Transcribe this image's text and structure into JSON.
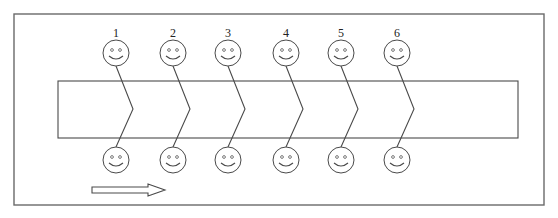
{
  "diagram": {
    "frame": {
      "x": 14,
      "y": 14,
      "width": 530,
      "height": 191
    },
    "band": {
      "x": 58,
      "y": 81,
      "width": 460,
      "height": 57
    },
    "figures": [
      {
        "label": "1",
        "x": 116
      },
      {
        "label": "2",
        "x": 173
      },
      {
        "label": "3",
        "x": 228
      },
      {
        "label": "4",
        "x": 286
      },
      {
        "label": "5",
        "x": 341
      },
      {
        "label": "6",
        "x": 397
      }
    ],
    "top_face_y": 53,
    "bottom_face_y": 160,
    "face_radius": 13,
    "label_y": 37,
    "zigzag_mid_y": 109,
    "zigzag_offset_x": 17,
    "arrow": {
      "direction": "right",
      "x1": 92,
      "x2": 165,
      "y": 190
    },
    "colors": {
      "stroke": "#4a4a4a",
      "frame": "#6a6a6a",
      "background": "#ffffff"
    }
  }
}
